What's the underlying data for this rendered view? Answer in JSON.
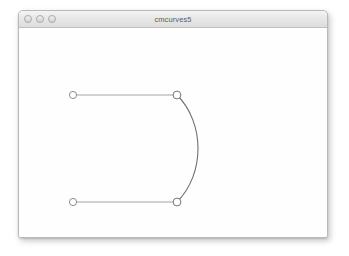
{
  "window": {
    "title": "cmcurves5",
    "controls": [
      {
        "name": "close",
        "label": ""
      },
      {
        "name": "minimize",
        "label": ""
      },
      {
        "name": "zoom",
        "label": ""
      }
    ]
  },
  "canvas": {
    "background_color": "#fefefe",
    "stroke_color": "#6f6f74",
    "handle_line_color": "#8d8d92",
    "point_fill": "#ffffff",
    "curve": {
      "type": "bezier",
      "start": {
        "x": 158,
        "y": 67
      },
      "end": {
        "x": 158,
        "y": 174
      },
      "control1": {
        "x": 186,
        "y": 95
      },
      "control2": {
        "x": 186,
        "y": 146
      }
    },
    "handles": [
      {
        "name": "handle-top",
        "from": {
          "x": 54,
          "y": 67
        },
        "to": {
          "x": 158,
          "y": 67
        }
      },
      {
        "name": "handle-bottom",
        "from": {
          "x": 54,
          "y": 174
        },
        "to": {
          "x": 158,
          "y": 174
        }
      }
    ],
    "points": [
      {
        "name": "control-point-top-left",
        "x": 54,
        "y": 67,
        "r": 3.6
      },
      {
        "name": "anchor-point-top-right",
        "x": 158,
        "y": 67,
        "r": 3.9
      },
      {
        "name": "control-point-bottom-left",
        "x": 54,
        "y": 174,
        "r": 3.6
      },
      {
        "name": "anchor-point-bottom-right",
        "x": 158,
        "y": 174,
        "r": 3.9
      }
    ]
  }
}
